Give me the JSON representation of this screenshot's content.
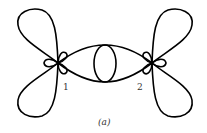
{
  "figure": {
    "caption": "(a)",
    "vertices": [
      {
        "id": "v1",
        "label": "1"
      },
      {
        "id": "v2",
        "label": "2"
      }
    ],
    "stroke_color": "#000000"
  }
}
